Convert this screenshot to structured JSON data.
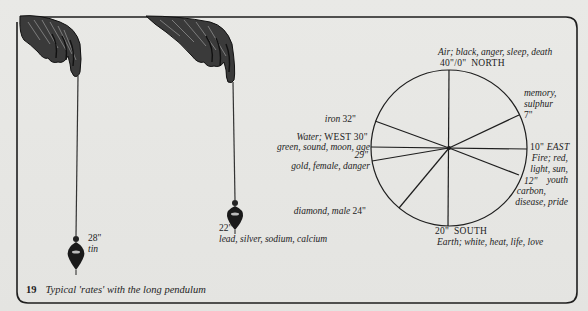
{
  "figure": {
    "number": "19",
    "caption": "Typical 'rates' with the long pendulum"
  },
  "pendulums": [
    {
      "rate": "28\"",
      "materials": "tin"
    },
    {
      "rate": "22\"",
      "materials": "lead, silver, sodium, calcium"
    }
  ],
  "rate_wheel": {
    "north": {
      "rate": "40\"/0\"",
      "direction": "NORTH",
      "attributes": "Air; black, anger, sleep, death"
    },
    "east": {
      "rate": "10\"",
      "direction": "EAST",
      "attributes_line1": "Fire; red,",
      "attributes_line2": "light, sun,",
      "attributes_line3": "youth"
    },
    "south": {
      "rate": "20\"",
      "direction": "SOUTH",
      "attributes": "Earth; white, heat, life, love"
    },
    "west": {
      "rate": "30\"",
      "direction": "WEST",
      "element": "Water;",
      "attributes": "green, sound, moon, age"
    },
    "spokes": [
      {
        "rate": "7\"",
        "label_line1": "memory,",
        "label_line2": "sulphur"
      },
      {
        "rate": "12\"",
        "label_line1": "carbon,",
        "label_line2": "disease, pride"
      },
      {
        "rate": "24\"",
        "label": "diamond, male"
      },
      {
        "rate": "29\"",
        "label": "gold, female, danger"
      },
      {
        "rate": "32\"",
        "label": "iron"
      }
    ]
  },
  "colors": {
    "paper": "#e6e6e3",
    "ink": "#1e1e1e"
  }
}
